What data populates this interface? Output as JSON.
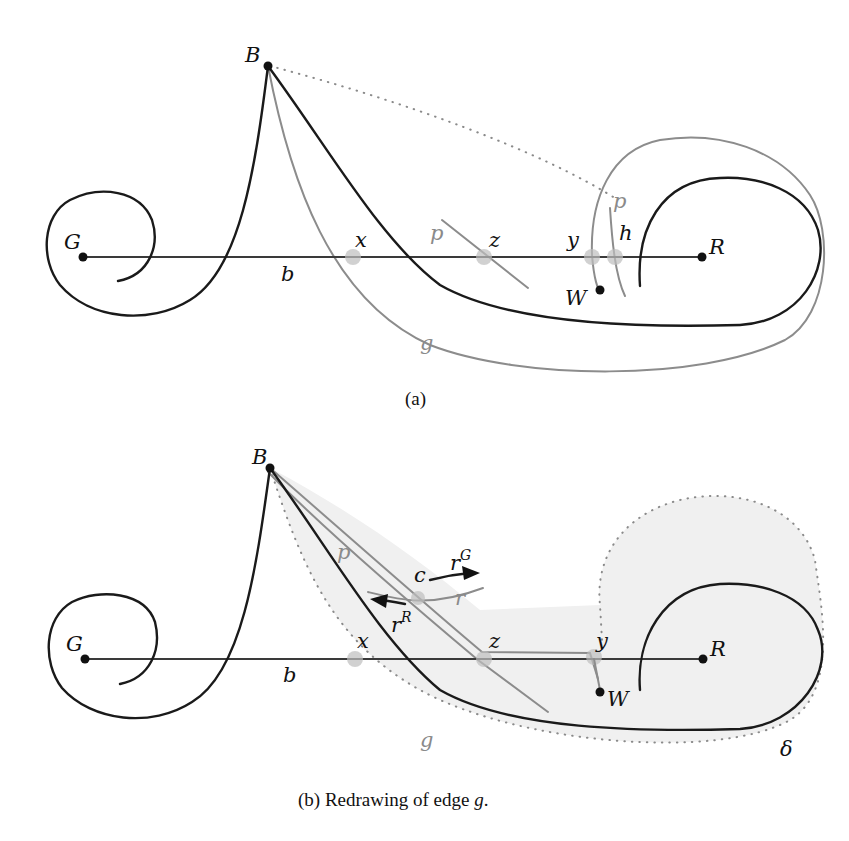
{
  "figure": {
    "panel_a": {
      "caption": "(a)",
      "vertices": {
        "B": "B",
        "G": "G",
        "R": "R",
        "W": "W"
      },
      "crossings": {
        "x": "x",
        "z": "z",
        "y": "y",
        "h": "h"
      },
      "edge_labels": {
        "b": "b",
        "g": "g",
        "p1": "p",
        "p2": "p"
      }
    },
    "panel_b": {
      "caption_prefix": "(b) Redrawing of edge ",
      "caption_edge": "g",
      "caption_suffix": ".",
      "vertices": {
        "B": "B",
        "G": "G",
        "R": "R",
        "W": "W"
      },
      "crossings": {
        "x": "x",
        "z": "z",
        "y": "y",
        "c": "c"
      },
      "edge_labels": {
        "b": "b",
        "g": "g",
        "p": "p",
        "r": "r",
        "delta": "δ"
      },
      "rays": {
        "rG_base": "r",
        "rG_sup": "G",
        "rR_base": "r",
        "rR_sup": "R"
      }
    },
    "colors": {
      "edge_black": "#1a1a1a",
      "edge_gray": "#8c8c8c",
      "region_fill": "#f0f0f0",
      "halo": "#bdbdbd"
    }
  }
}
